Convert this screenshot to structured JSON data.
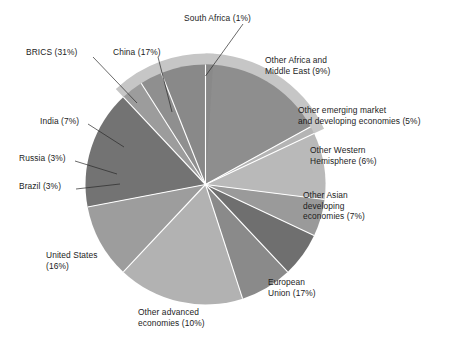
{
  "chart_data": {
    "type": "pie",
    "title": "",
    "subtitle": "",
    "xlabel": "",
    "ylabel": "",
    "units": "percent",
    "legend_position": "callout-labels",
    "grid": false,
    "total": 100,
    "categories": [
      "China",
      "South Africa",
      "Other Africa and Middle East",
      "Other emerging market and developing economies",
      "Other Western Hemisphere",
      "Other Asian developing economies",
      "European Union",
      "Other advanced economies",
      "United States",
      "Brazil",
      "Russia",
      "India"
    ],
    "values": [
      17,
      1,
      9,
      5,
      6,
      7,
      17,
      10,
      16,
      3,
      3,
      7
    ],
    "groups": [
      {
        "name": "BRICS",
        "value": 31,
        "members": [
          "China",
          "South Africa",
          "Brazil",
          "Russia",
          "India"
        ]
      }
    ],
    "slices": [
      {
        "key": "china",
        "label": "China (17%)",
        "value": 17,
        "color": "#8e8e8e",
        "brics": true
      },
      {
        "key": "south-africa",
        "label": "South Africa (1%)",
        "value": 1,
        "color": "#b4b4b4",
        "brics": true
      },
      {
        "key": "other-africa-me",
        "label": "Other Africa and\nMiddle East (9%)",
        "value": 9,
        "color": "#b9b9b9",
        "brics": false
      },
      {
        "key": "other-emerging",
        "label": "Other emerging market\nand developing economies (5%)",
        "value": 5,
        "color": "#9a9a9a",
        "brics": false
      },
      {
        "key": "other-western",
        "label": "Other Western\nHemisphere (6%)",
        "value": 6,
        "color": "#6f6f6f",
        "brics": false
      },
      {
        "key": "other-asian",
        "label": "Other Asian\ndeveloping\neconomies (7%)",
        "value": 7,
        "color": "#8a8a8a",
        "brics": false
      },
      {
        "key": "european-union",
        "label": "European\nUnion (17%)",
        "value": 17,
        "color": "#b2b2b2",
        "brics": false
      },
      {
        "key": "other-advanced",
        "label": "Other advanced\neconomies (10%)",
        "value": 10,
        "color": "#9d9d9d",
        "brics": false
      },
      {
        "key": "united-states",
        "label": "United States\n(16%)",
        "value": 16,
        "color": "#737373",
        "brics": false
      },
      {
        "key": "brazil",
        "label": "Brazil (3%)",
        "value": 3,
        "color": "#9c9c9c",
        "brics": true
      },
      {
        "key": "russia",
        "label": "Russia (3%)",
        "value": 3,
        "color": "#8f8f8f",
        "brics": true
      },
      {
        "key": "india",
        "label": "India (7%)",
        "value": 7,
        "color": "#898989",
        "brics": true
      }
    ],
    "brics_band": {
      "label": "BRICS (31%)",
      "value": 31,
      "color": "#c6c6c6"
    }
  },
  "labels": {
    "south_africa": "South Africa (1%)",
    "brics": "BRICS (31%)",
    "china": "China (17%)",
    "india": "India (7%)",
    "russia": "Russia (3%)",
    "brazil": "Brazil (3%)",
    "united_states": "United States\n(16%)",
    "other_advanced": "Other advanced\neconomies (10%)",
    "european_union": "European\nUnion (17%)",
    "other_asian": "Other Asian\ndeveloping\neconomies (7%)",
    "other_western": "Other Western\nHemisphere (6%)",
    "other_emerging": "Other emerging market\nand developing economies (5%)",
    "other_africa_me": "Other Africa and\nMiddle East (9%)"
  }
}
